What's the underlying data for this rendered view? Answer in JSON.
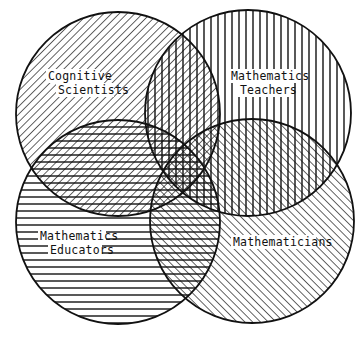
{
  "diagram": {
    "type": "venn",
    "set_count": 4,
    "stroke_color": "#111111",
    "background": "#ffffff",
    "sets": [
      {
        "id": "cognitive-scientists",
        "label_lines": [
          "Cognitive",
          "Scientists"
        ],
        "hatch": "diagonal-forward",
        "cx": 118,
        "cy": 114,
        "r": 102
      },
      {
        "id": "mathematics-teachers",
        "label_lines": [
          "Mathematics",
          "Teachers"
        ],
        "hatch": "vertical",
        "cx": 248,
        "cy": 113,
        "r": 103
      },
      {
        "id": "mathematics-educators",
        "label_lines": [
          "Mathematics",
          "Educators"
        ],
        "hatch": "horizontal",
        "cx": 118,
        "cy": 222,
        "r": 102
      },
      {
        "id": "mathematicians",
        "label_lines": [
          "Mathematicians"
        ],
        "hatch": "diagonal-backward",
        "cx": 252,
        "cy": 221,
        "r": 102
      }
    ]
  },
  "labels": {
    "cs_line1": "Cognitive",
    "cs_line2": "Scientists",
    "mt_line1": "Mathematics",
    "mt_line2": "Teachers",
    "me_line1": "Mathematics",
    "me_line2": "Educators",
    "m_line1": "Mathematicians"
  }
}
